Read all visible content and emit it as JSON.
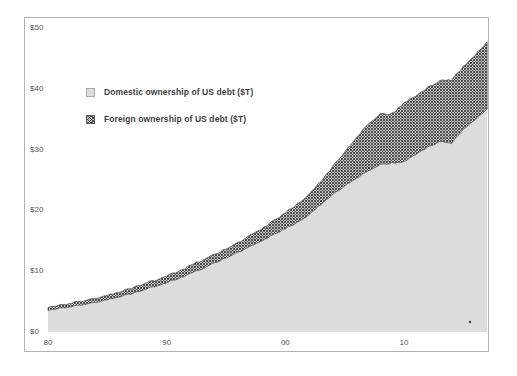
{
  "chart_data": {
    "type": "area",
    "stacked": true,
    "title": "",
    "xlabel": "",
    "ylabel": "",
    "grid": false,
    "legend_position": "upper-left-inside",
    "xlim": [
      1980,
      2017
    ],
    "ylim": [
      0,
      50
    ],
    "x": [
      1980,
      1981,
      1982,
      1983,
      1984,
      1985,
      1986,
      1987,
      1988,
      1989,
      1990,
      1991,
      1992,
      1993,
      1994,
      1995,
      1996,
      1997,
      1998,
      1999,
      2000,
      2001,
      2002,
      2003,
      2004,
      2005,
      2006,
      2007,
      2008,
      2009,
      2010,
      2011,
      2012,
      2013,
      2014,
      2015,
      2016,
      2017
    ],
    "series": [
      {
        "name": "Domestic ownership of US debt ($T)",
        "swatch": "light-gray-solid",
        "values": [
          3.6,
          3.9,
          4.2,
          4.5,
          4.9,
          5.3,
          5.8,
          6.3,
          6.9,
          7.5,
          8.1,
          8.8,
          9.6,
          10.4,
          11.3,
          12.2,
          13.1,
          14.0,
          15.0,
          16.0,
          17.0,
          18.0,
          19.3,
          21.0,
          22.6,
          24.0,
          25.3,
          26.5,
          27.5,
          27.8,
          28.0,
          29.2,
          30.4,
          31.3,
          31.0,
          33.3,
          35.0,
          36.6
        ]
      },
      {
        "name": "Foreign ownership of US debt ($T)",
        "swatch": "dark-crosshatch",
        "values": [
          0.5,
          0.5,
          0.6,
          0.6,
          0.7,
          0.7,
          0.8,
          0.9,
          1.0,
          1.0,
          1.1,
          1.2,
          1.3,
          1.4,
          1.4,
          1.5,
          1.6,
          1.8,
          2.0,
          2.3,
          2.6,
          3.0,
          3.4,
          3.8,
          4.6,
          5.6,
          6.7,
          7.7,
          8.3,
          8.1,
          9.7,
          9.6,
          9.8,
          10.0,
          10.4,
          10.3,
          10.6,
          11.0
        ]
      }
    ],
    "y_tick_labels": [
      "$50",
      "$40",
      "$30",
      "$20",
      "$10",
      "$0"
    ],
    "y_tick_values": [
      50,
      40,
      30,
      20,
      10,
      0
    ],
    "x_tick_labels": [
      "80",
      "90",
      "00",
      "10"
    ],
    "x_tick_years": [
      1980,
      1990,
      2000,
      2010
    ]
  },
  "colors": {
    "domestic_fill": "#dcdcdc",
    "foreign_hatch_dark": "#4f4f4f",
    "foreign_hatch_light": "#c4c4c4",
    "foreign_edge": "#5a5a5a",
    "axis_text": "#595959",
    "legend_text": "#3f3f3f",
    "frame_border": "#b3b3b3",
    "stray_mark": "#4d4d4d"
  }
}
